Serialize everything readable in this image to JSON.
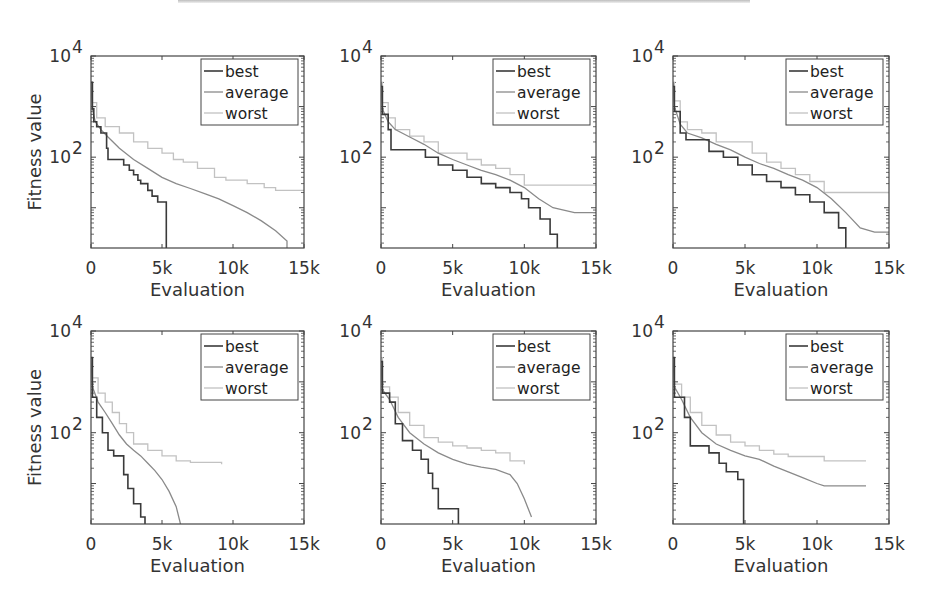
{
  "figure": {
    "rows": 2,
    "cols": 3
  },
  "colors": {
    "best": "#3a3a3a",
    "average": "#8a8a8a",
    "worst": "#c2c2c2",
    "axis": "#444444"
  },
  "chart_data": [
    {
      "type": "line",
      "panel": "top-left",
      "title": "",
      "xlabel": "Evaluation",
      "ylabel": "Fitness value",
      "xlim": [
        0,
        15000
      ],
      "ylim": [
        1.6,
        10000
      ],
      "yscale": "log",
      "xticks": [
        0,
        5000,
        10000,
        15000
      ],
      "xtick_labels": [
        "0",
        "5k",
        "10k",
        "15k"
      ],
      "yticks": [
        100,
        10000
      ],
      "ytick_labels": [
        "10^2",
        "10^4"
      ],
      "legend": {
        "entries": [
          "best",
          "average",
          "worst"
        ],
        "placement": "top-right"
      },
      "series": [
        {
          "name": "best",
          "step": true,
          "x": [
            0,
            100,
            200,
            400,
            700,
            1100,
            1200,
            2300,
            2700,
            3000,
            3300,
            3500,
            4000,
            4300,
            4700,
            5300,
            5300
          ],
          "y": [
            3000,
            900,
            500,
            400,
            300,
            150,
            90,
            70,
            55,
            45,
            35,
            30,
            22,
            17,
            13,
            8,
            1.6
          ]
        },
        {
          "name": "average",
          "step": false,
          "x": [
            0,
            100,
            300,
            700,
            1200,
            2000,
            3000,
            4000,
            5000,
            6000,
            7000,
            8000,
            9000,
            10000,
            11000,
            12000,
            13000,
            13800,
            13800
          ],
          "y": [
            3000,
            900,
            500,
            350,
            250,
            150,
            90,
            60,
            40,
            30,
            24,
            19,
            15,
            11,
            8,
            5.5,
            3.5,
            2.2,
            1.6
          ]
        },
        {
          "name": "worst",
          "step": true,
          "x": [
            0,
            100,
            400,
            1000,
            2000,
            3000,
            4000,
            5000,
            5800,
            6500,
            7500,
            8700,
            9500,
            11000,
            12200,
            13000,
            15000
          ],
          "y": [
            3000,
            1200,
            600,
            400,
            300,
            200,
            150,
            120,
            90,
            80,
            60,
            40,
            35,
            30,
            25,
            22,
            22
          ]
        }
      ]
    },
    {
      "type": "line",
      "panel": "top-middle",
      "title": "",
      "xlabel": "Evaluation",
      "ylabel": "",
      "xlim": [
        0,
        15000
      ],
      "ylim": [
        1.6,
        10000
      ],
      "yscale": "log",
      "xticks": [
        0,
        5000,
        10000,
        15000
      ],
      "xtick_labels": [
        "0",
        "5k",
        "10k",
        "15k"
      ],
      "yticks": [
        100,
        10000
      ],
      "ytick_labels": [
        "10^2",
        "10^4"
      ],
      "legend": {
        "entries": [
          "best",
          "average",
          "worst"
        ],
        "placement": "top-right"
      },
      "series": [
        {
          "name": "best",
          "step": true,
          "x": [
            0,
            100,
            500,
            700,
            2500,
            3100,
            4000,
            5000,
            6000,
            7000,
            8000,
            9000,
            9800,
            10300,
            11100,
            11800,
            12300,
            12300
          ],
          "y": [
            2500,
            700,
            350,
            140,
            140,
            100,
            70,
            55,
            40,
            30,
            25,
            20,
            15,
            10,
            6,
            3,
            2.2,
            1.6
          ]
        },
        {
          "name": "average",
          "step": false,
          "x": [
            0,
            100,
            500,
            1000,
            2000,
            3000,
            4000,
            5000,
            6000,
            7000,
            8000,
            9000,
            10000,
            11000,
            12000,
            13500,
            15000
          ],
          "y": [
            3000,
            900,
            500,
            350,
            250,
            180,
            120,
            90,
            70,
            55,
            45,
            35,
            25,
            15,
            10,
            8,
            8
          ]
        },
        {
          "name": "worst",
          "step": true,
          "x": [
            0,
            100,
            500,
            1000,
            2000,
            3000,
            4000,
            6000,
            7000,
            8000,
            9000,
            10000,
            15000
          ],
          "y": [
            3000,
            1200,
            600,
            350,
            260,
            200,
            120,
            90,
            70,
            60,
            45,
            28,
            28
          ]
        }
      ]
    },
    {
      "type": "line",
      "panel": "top-right",
      "title": "",
      "xlabel": "Evaluation",
      "ylabel": "",
      "xlim": [
        0,
        15000
      ],
      "ylim": [
        1.6,
        10000
      ],
      "yscale": "log",
      "xticks": [
        0,
        5000,
        10000,
        15000
      ],
      "xtick_labels": [
        "0",
        "5k",
        "10k",
        "15k"
      ],
      "yticks": [
        100,
        10000
      ],
      "ytick_labels": [
        "10^2",
        "10^4"
      ],
      "legend": {
        "entries": [
          "best",
          "average",
          "worst"
        ],
        "placement": "top-right"
      },
      "series": [
        {
          "name": "best",
          "step": true,
          "x": [
            0,
            100,
            500,
            900,
            2500,
            2500,
            3500,
            4500,
            5500,
            6500,
            7500,
            8500,
            9500,
            10500,
            11500,
            12000,
            12000
          ],
          "y": [
            2500,
            800,
            300,
            220,
            200,
            130,
            100,
            70,
            45,
            33,
            25,
            18,
            13,
            8,
            4,
            2.2,
            1.6
          ]
        },
        {
          "name": "average",
          "step": false,
          "x": [
            0,
            100,
            500,
            1000,
            2000,
            3000,
            4000,
            5000,
            6000,
            7000,
            8000,
            9000,
            10000,
            11000,
            12000,
            13000,
            14000,
            15000
          ],
          "y": [
            3000,
            1000,
            450,
            300,
            240,
            180,
            140,
            100,
            75,
            60,
            45,
            35,
            25,
            15,
            8,
            4,
            3.3,
            3.3
          ]
        },
        {
          "name": "worst",
          "step": true,
          "x": [
            0,
            100,
            500,
            1000,
            2000,
            3000,
            5500,
            6500,
            7500,
            8500,
            9500,
            10500,
            15000
          ],
          "y": [
            3000,
            1300,
            500,
            350,
            300,
            200,
            120,
            80,
            60,
            45,
            33,
            20,
            20
          ]
        }
      ]
    },
    {
      "type": "line",
      "panel": "bottom-left",
      "title": "",
      "xlabel": "Evaluation",
      "ylabel": "Fitness value",
      "xlim": [
        0,
        15000
      ],
      "ylim": [
        1.6,
        10000
      ],
      "yscale": "log",
      "xticks": [
        0,
        5000,
        10000,
        15000
      ],
      "xtick_labels": [
        "0",
        "5k",
        "10k",
        "15k"
      ],
      "yticks": [
        100,
        10000
      ],
      "ytick_labels": [
        "10^2",
        "10^4"
      ],
      "legend": {
        "entries": [
          "best",
          "average",
          "worst"
        ],
        "placement": "top-right"
      },
      "series": [
        {
          "name": "best",
          "step": true,
          "x": [
            0,
            100,
            400,
            800,
            1200,
            1600,
            2300,
            2600,
            3000,
            3500,
            3800,
            3800
          ],
          "y": [
            3000,
            500,
            200,
            100,
            45,
            35,
            15,
            8,
            4,
            2.2,
            2.2,
            1.6
          ]
        },
        {
          "name": "average",
          "step": false,
          "x": [
            0,
            100,
            500,
            1000,
            1500,
            2000,
            2500,
            3000,
            3500,
            4000,
            4500,
            5000,
            5500,
            6000,
            6300
          ],
          "y": [
            3000,
            800,
            400,
            250,
            150,
            90,
            60,
            45,
            35,
            25,
            18,
            12,
            7,
            3.5,
            1.6
          ]
        },
        {
          "name": "worst",
          "step": true,
          "x": [
            0,
            100,
            500,
            1000,
            1500,
            2000,
            2500,
            3000,
            4000,
            5000,
            6000,
            7000,
            9200
          ],
          "y": [
            3000,
            1200,
            600,
            400,
            250,
            150,
            100,
            60,
            45,
            35,
            28,
            26,
            24
          ]
        }
      ]
    },
    {
      "type": "line",
      "panel": "bottom-middle",
      "title": "",
      "xlabel": "Evaluation",
      "ylabel": "",
      "xlim": [
        0,
        15000
      ],
      "ylim": [
        1.6,
        10000
      ],
      "yscale": "log",
      "xticks": [
        0,
        5000,
        10000,
        15000
      ],
      "xtick_labels": [
        "0",
        "5k",
        "10k",
        "15k"
      ],
      "yticks": [
        100,
        10000
      ],
      "ytick_labels": [
        "10^2",
        "10^4"
      ],
      "legend": {
        "entries": [
          "best",
          "average",
          "worst"
        ],
        "placement": "top-right"
      },
      "series": [
        {
          "name": "best",
          "step": true,
          "x": [
            0,
            100,
            600,
            1000,
            1500,
            2200,
            2800,
            3300,
            3600,
            4000,
            5000,
            5400,
            5400
          ],
          "y": [
            2500,
            600,
            400,
            150,
            70,
            45,
            30,
            16,
            8,
            3.2,
            3.2,
            2.2,
            1.6
          ]
        },
        {
          "name": "average",
          "step": false,
          "x": [
            0,
            100,
            600,
            1200,
            2000,
            3000,
            4000,
            5000,
            6000,
            7000,
            8000,
            9000,
            9500,
            10000,
            10500
          ],
          "y": [
            2500,
            700,
            450,
            200,
            100,
            60,
            40,
            30,
            24,
            21,
            19,
            15,
            10,
            5,
            2.2
          ]
        },
        {
          "name": "worst",
          "step": true,
          "x": [
            0,
            100,
            600,
            1200,
            2000,
            3000,
            4000,
            5000,
            6000,
            7000,
            8000,
            9000,
            10000
          ],
          "y": [
            3000,
            800,
            500,
            250,
            140,
            80,
            65,
            55,
            50,
            45,
            40,
            28,
            24
          ]
        }
      ]
    },
    {
      "type": "line",
      "panel": "bottom-right",
      "title": "",
      "xlabel": "Evaluation",
      "ylabel": "",
      "xlim": [
        0,
        15000
      ],
      "ylim": [
        1.6,
        10000
      ],
      "yscale": "log",
      "xticks": [
        0,
        5000,
        10000,
        15000
      ],
      "xtick_labels": [
        "0",
        "5k",
        "10k",
        "15k"
      ],
      "yticks": [
        100,
        10000
      ],
      "ytick_labels": [
        "10^2",
        "10^4"
      ],
      "legend": {
        "entries": [
          "best",
          "average",
          "worst"
        ],
        "placement": "top-right"
      },
      "series": [
        {
          "name": "best",
          "step": true,
          "x": [
            0,
            100,
            800,
            1200,
            2500,
            3200,
            3700,
            4500,
            4900,
            4900
          ],
          "y": [
            3000,
            500,
            200,
            55,
            40,
            25,
            17,
            12,
            5,
            1.6
          ]
        },
        {
          "name": "average",
          "step": false,
          "x": [
            0,
            100,
            600,
            1200,
            2000,
            3000,
            4000,
            5000,
            6000,
            7000,
            8000,
            9000,
            10000,
            10500,
            13400
          ],
          "y": [
            3000,
            800,
            450,
            200,
            100,
            60,
            45,
            35,
            30,
            22,
            17,
            13,
            10,
            9,
            9
          ]
        },
        {
          "name": "worst",
          "step": true,
          "x": [
            0,
            100,
            600,
            1200,
            2000,
            3000,
            4000,
            5000,
            6000,
            7000,
            8000,
            10500,
            13400
          ],
          "y": [
            3000,
            900,
            500,
            250,
            140,
            90,
            65,
            55,
            45,
            38,
            34,
            28,
            28
          ]
        }
      ]
    }
  ]
}
